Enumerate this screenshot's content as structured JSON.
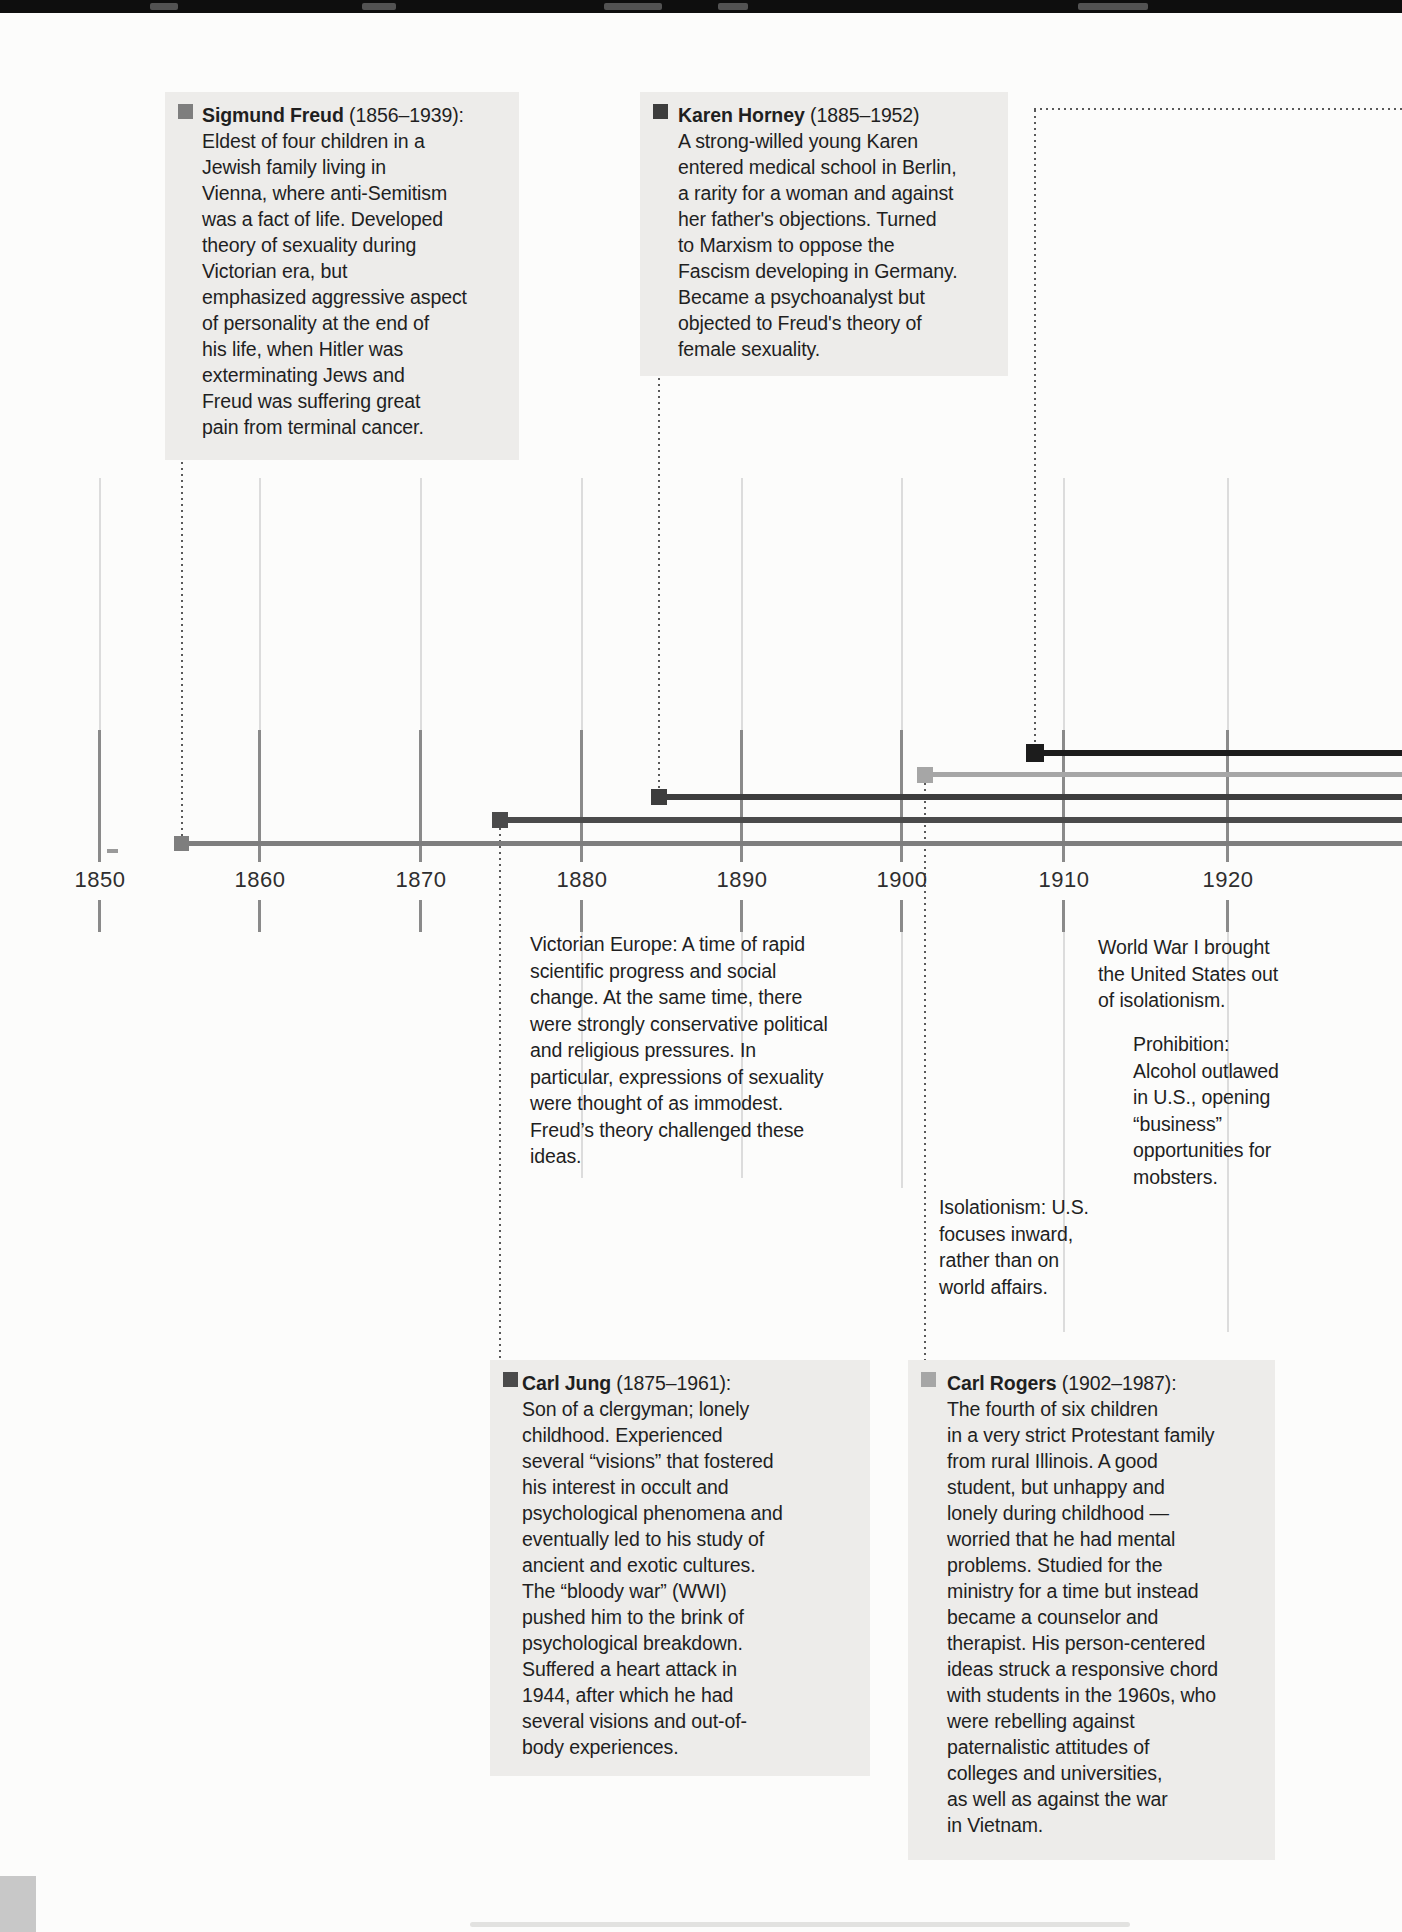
{
  "figure": {
    "title_semantic": "Timeline of personality theorists and historical context, 1850-1930",
    "axis": {
      "labels": [
        "1850",
        "1860",
        "1870",
        "1880",
        "1890",
        "1900",
        "1910",
        "1920"
      ]
    },
    "people": [
      {
        "id": "freud",
        "name": "Sigmund Freud",
        "dates": "(1856–1939):",
        "color": "#7e7e7e",
        "bio": "Eldest of four children in a\nJewish family living in\nVienna, where anti-Semitism\nwas a fact of life. Developed\ntheory of sexuality during\nVictorian era, but\nemphasized aggressive aspect\nof personality at the end of\nhis life, when Hitler was\nexterminating Jews and\nFreud was suffering great\npain from terminal cancer."
      },
      {
        "id": "horney",
        "name": "Karen Horney",
        "dates": "(1885–1952)",
        "color": "#3d3d3d",
        "bio": "A strong-willed young Karen\nentered medical school in Berlin,\na rarity for a woman and against\nher father's objections. Turned\nto Marxism to oppose the\nFascism developing in Germany.\nBecame a psychoanalyst but\nobjected to Freud's theory of\nfemale sexuality."
      },
      {
        "id": "jung",
        "name": "Carl Jung",
        "dates": "(1875–1961):",
        "color": "#4b4b4b",
        "bio": "Son of a clergyman; lonely\nchildhood. Experienced\nseveral “visions” that fostered\nhis interest in occult and\npsychological phenomena and\neventually led to his study of\nancient and exotic cultures.\nThe “bloody war” (WWI)\npushed him to the brink of\npsychological breakdown.\nSuffered a heart attack in\n1944, after which he had\nseveral visions and out-of-\nbody experiences."
      },
      {
        "id": "rogers",
        "name": "Carl Rogers",
        "dates": "(1902–1987):",
        "color": "#a6a6a6",
        "bio": "The fourth of six children\nin a very strict Protestant family\nfrom rural Illinois. A good\nstudent, but unhappy and\nlonely during childhood —\nworried that he had mental\nproblems. Studied for the\nministry for a time but instead\nbecame a counselor and\ntherapist. His person-centered\nideas struck a responsive chord\nwith students in the 1960s, who\nwere rebelling against\npaternalistic attitudes of\ncolleges and universities,\nas well as against the war\nin Vietnam."
      }
    ],
    "unlabeled_bar": {
      "color": "#1c1c1c"
    },
    "notes": {
      "victorian": "Victorian Europe: A time of rapid\nscientific progress and social\nchange. At the same time, there\nwere strongly conservative political\nand religious pressures. In\nparticular, expressions of sexuality\nwere thought of as immodest.\nFreud’s theory challenged these\nideas.",
      "wwi": "World War I brought\nthe United States out\nof isolationism.",
      "prohibition": "Prohibition:\nAlcohol outlawed\nin U.S., opening\n“business”\nopportunities for\nmobsters.",
      "isolationism": "Isolationism: U.S.\nfocuses inward,\nrather than on\nworld affairs."
    },
    "colors": {
      "gridline_light": "#dcdcdc",
      "gridline_dark": "#8a8a8a",
      "box_background": "#edecea",
      "page_edge": "#0e0e0e"
    }
  }
}
